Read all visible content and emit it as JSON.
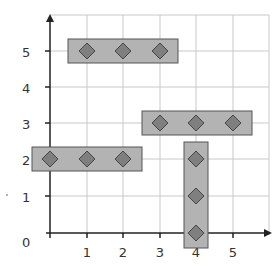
{
  "diagram": {
    "type": "coordinate-grid",
    "x_labels": [
      "1",
      "2",
      "3",
      "4",
      "5"
    ],
    "y_labels": [
      "1",
      "2",
      "3",
      "4",
      "5"
    ],
    "origin_label": "0",
    "colors": {
      "grid": "#c8c8c8",
      "axis": "#222222",
      "bar_fill": "#b3b3b3",
      "bar_stroke": "#555555",
      "diamond_fill": "#7f7f7f",
      "diamond_stroke": "#444444"
    },
    "groups": [
      {
        "name": "row-y5",
        "orientation": "horizontal",
        "points": [
          [
            1,
            5
          ],
          [
            2,
            5
          ],
          [
            3,
            5
          ]
        ]
      },
      {
        "name": "row-y3",
        "orientation": "horizontal",
        "points": [
          [
            3,
            3
          ],
          [
            4,
            3
          ],
          [
            5,
            3
          ]
        ]
      },
      {
        "name": "row-y2",
        "orientation": "horizontal",
        "points": [
          [
            0,
            2
          ],
          [
            1,
            2
          ],
          [
            2,
            2
          ]
        ]
      },
      {
        "name": "column-x4",
        "orientation": "vertical",
        "points": [
          [
            4,
            2
          ],
          [
            4,
            1
          ],
          [
            4,
            0
          ]
        ]
      }
    ]
  }
}
